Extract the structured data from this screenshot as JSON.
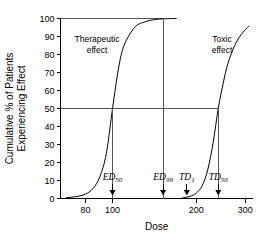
{
  "chart_data": {
    "type": "line",
    "title": "",
    "xlabel": "Dose",
    "ylabel_line1": "Cumulative % of Patients",
    "ylabel_line2": "Experiencing Effect",
    "xscale": "log",
    "xlim": [
      65,
      320
    ],
    "ylim": [
      0,
      100
    ],
    "xticks": [
      80,
      100,
      200,
      300
    ],
    "xtick_labels": [
      "80",
      "100",
      "200",
      "300"
    ],
    "yticks": [
      0,
      10,
      20,
      30,
      40,
      50,
      60,
      70,
      80,
      90,
      100
    ],
    "ytick_labels": [
      "0",
      "10",
      "20",
      "30",
      "40",
      "50",
      "60",
      "70",
      "80",
      "90",
      "100"
    ],
    "grid": false,
    "legend": "none",
    "series": [
      {
        "name": "Therapeutic effect",
        "label": "Therapeutic",
        "label_line2": "effect",
        "ec50": 100,
        "hill": 7.5,
        "x_start": 68,
        "x_end": 170,
        "points": [
          {
            "x": 68,
            "y": 0.4
          },
          {
            "x": 75,
            "y": 1.2
          },
          {
            "x": 80,
            "y": 2.5
          },
          {
            "x": 85,
            "y": 5.5
          },
          {
            "x": 90,
            "y": 12
          },
          {
            "x": 95,
            "y": 25
          },
          {
            "x": 100,
            "y": 50
          },
          {
            "x": 105,
            "y": 72
          },
          {
            "x": 110,
            "y": 85
          },
          {
            "x": 120,
            "y": 95
          },
          {
            "x": 130,
            "y": 98
          },
          {
            "x": 145,
            "y": 99.6
          },
          {
            "x": 170,
            "y": 100
          }
        ]
      },
      {
        "name": "Toxic effect",
        "label": "Toxic",
        "label_line2": "effect",
        "ec50": 240,
        "hill": 7.5,
        "x_start": 178,
        "x_end": 310,
        "points": [
          {
            "x": 178,
            "y": 0.3
          },
          {
            "x": 190,
            "y": 1.2
          },
          {
            "x": 200,
            "y": 3
          },
          {
            "x": 210,
            "y": 7
          },
          {
            "x": 220,
            "y": 16
          },
          {
            "x": 230,
            "y": 31
          },
          {
            "x": 240,
            "y": 50
          },
          {
            "x": 250,
            "y": 64
          },
          {
            "x": 260,
            "y": 75
          },
          {
            "x": 275,
            "y": 85
          },
          {
            "x": 290,
            "y": 91
          },
          {
            "x": 310,
            "y": 96
          }
        ]
      }
    ],
    "reference_lines": [
      {
        "name": "hundred-percent-line",
        "y": 100,
        "x_from": 65,
        "x_to": 152
      },
      {
        "name": "fifty-percent-line",
        "y": 50,
        "x_from": 65,
        "x_to": 240
      }
    ],
    "annotations": [
      {
        "id": "ed50",
        "base": "ED",
        "sub": "50",
        "dose": 100,
        "value_percent": 50,
        "line_from_y": 50,
        "line_to_y": 0
      },
      {
        "id": "ed99",
        "base": "ED",
        "sub": "99",
        "dose": 152,
        "value_percent": 99,
        "line_from_y": 100,
        "line_to_y": 0
      },
      {
        "id": "td1",
        "base": "TD",
        "sub": "1",
        "dose": 185,
        "value_percent": 1,
        "line_from_y": 0,
        "line_to_y": 0
      },
      {
        "id": "td50",
        "base": "TD",
        "sub": "50",
        "dose": 240,
        "value_percent": 50,
        "line_from_y": 50,
        "line_to_y": 0
      }
    ]
  }
}
